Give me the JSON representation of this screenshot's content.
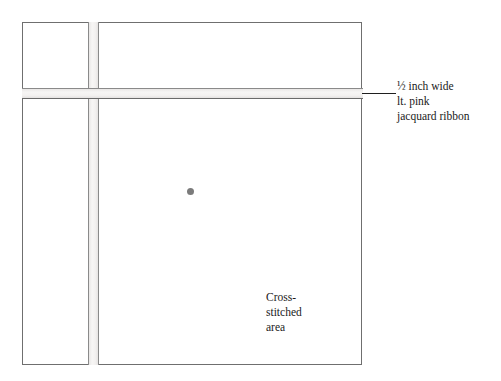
{
  "diagram": {
    "background_color": "#ffffff",
    "panel": {
      "name": "fabric-panel",
      "stroke_color": "#6f6f6f",
      "fill_color": "#ffffff"
    },
    "ribbons": [
      {
        "orientation": "horizontal",
        "fill_color": "#f2f0ef",
        "edge_color": "#7a7a7a",
        "width_label": "½ inch wide"
      },
      {
        "orientation": "vertical",
        "fill_color": "#f2f0ef",
        "edge_color": "#7a7a7a",
        "width_label": "½ inch wide"
      }
    ],
    "center_marker": {
      "name": "center-dot",
      "color": "#7b7b7b"
    },
    "area_label": {
      "lines": [
        "Cross-",
        "stitched",
        "area"
      ]
    },
    "callout": {
      "lines": [
        "½ inch wide",
        "lt. pink",
        "jacquard ribbon"
      ],
      "leader_line_color": "#1f1f1f"
    }
  }
}
